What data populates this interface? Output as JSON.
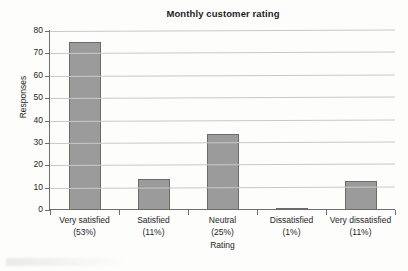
{
  "chart_data": {
    "type": "bar",
    "title": "Monthly customer rating",
    "xlabel": "Rating",
    "ylabel": "Responses",
    "categories": [
      "Very satisfied",
      "Satisfied",
      "Neutral",
      "Dissatisfied",
      "Very dissatisfied"
    ],
    "category_percents": [
      "(53%)",
      "(11%)",
      "(25%)",
      "(1%)",
      "(11%)"
    ],
    "values": [
      75,
      14,
      34,
      1,
      13
    ],
    "ylim": [
      0,
      80
    ],
    "yticks": [
      0,
      10,
      20,
      30,
      40,
      50,
      60,
      70,
      80
    ],
    "ytick_labels": [
      "0",
      "10",
      "20",
      "30",
      "40",
      "50",
      "60",
      "70",
      "80"
    ],
    "grid": true,
    "legend": "none",
    "bar_fill": "#9b9b9b",
    "bar_border": "#6b6b6b",
    "gridline_color": "#c9c9c9",
    "axis_color": "#6e6e6e",
    "background": "#fdfdfc"
  }
}
